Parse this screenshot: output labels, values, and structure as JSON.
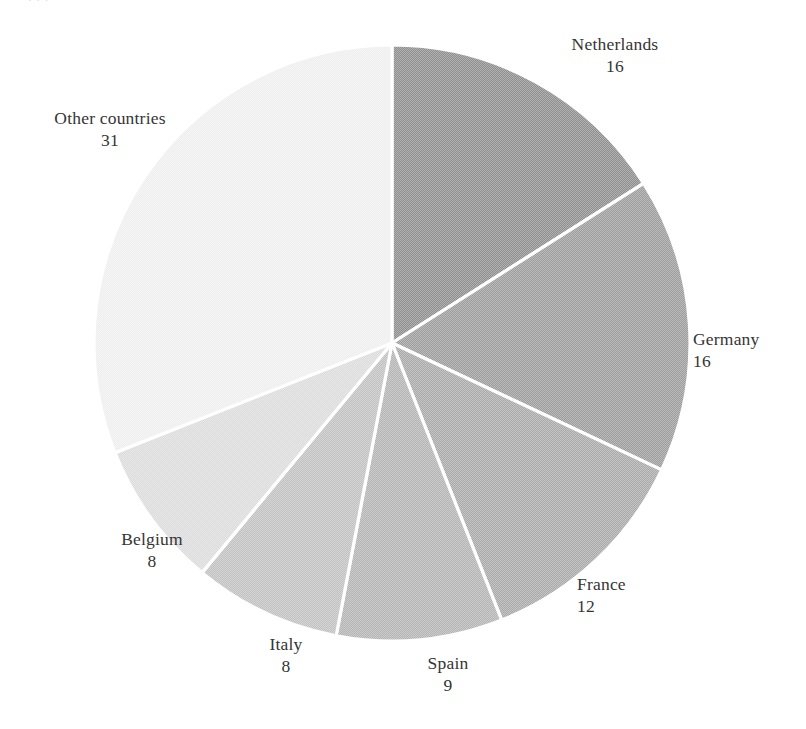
{
  "page": {
    "background_color": "#ffffff",
    "top_sliver_text": "·                                    ·           ·"
  },
  "chart_data": {
    "type": "pie",
    "title": "",
    "subtitle": "",
    "xlabel": "",
    "ylabel": "",
    "legend_position": "none",
    "grid": false,
    "start_angle_deg": 0,
    "direction": "clockwise",
    "units": "percent",
    "total": 100,
    "separator_color": "#ffffff",
    "categories": [
      "Netherlands",
      "Germany",
      "France",
      "Spain",
      "Italy",
      "Belgium",
      "Other countries"
    ],
    "values": [
      16,
      16,
      12,
      9,
      8,
      8,
      31
    ],
    "slices": [
      {
        "label": "Netherlands",
        "value": 16,
        "color": "#8f8f8f"
      },
      {
        "label": "Germany",
        "value": 16,
        "color": "#9d9d9d"
      },
      {
        "label": "France",
        "value": 12,
        "color": "#aaaaaa"
      },
      {
        "label": "Spain",
        "value": 9,
        "color": "#b5b5b5"
      },
      {
        "label": "Italy",
        "value": 8,
        "color": "#c2c2c2"
      },
      {
        "label": "Belgium",
        "value": 8,
        "color": "#dcdcdc"
      },
      {
        "label": "Other countries",
        "value": 31,
        "color": "#efefef"
      }
    ],
    "geometry": {
      "center_x": 392,
      "center_y": 343,
      "radius": 298
    }
  },
  "labels": {
    "netherlands": {
      "name": "Netherlands",
      "value": "16"
    },
    "germany": {
      "name": "Germany",
      "value": "16"
    },
    "france": {
      "name": "France",
      "value": "12"
    },
    "spain": {
      "name": "Spain",
      "value": "9"
    },
    "italy": {
      "name": "Italy",
      "value": "8"
    },
    "belgium": {
      "name": "Belgium",
      "value": "8"
    },
    "other": {
      "name": "Other countries",
      "value": "31"
    }
  }
}
